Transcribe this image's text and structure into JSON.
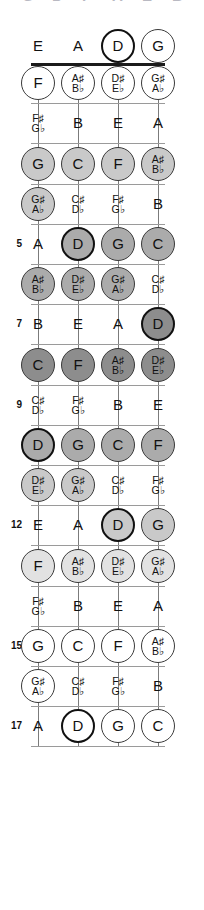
{
  "diagram": {
    "instrument": "4-string bass",
    "orientation": "vertical",
    "clipped_top_glyphs": [
      "G",
      "D",
      "F",
      "A",
      "E",
      "B"
    ],
    "strings": [
      "E",
      "A",
      "D",
      "G"
    ],
    "fret_numbers_shown": [
      "5",
      "7",
      "9",
      "12",
      "15",
      "17"
    ],
    "colors": {
      "nut": "#1b1b1b",
      "fretline": "#9a9a9a",
      "string": "#7b7b7b",
      "ring": "#3a3a3a",
      "root_ring": "#111111",
      "text": "#111111",
      "shade_dark": "#8d8d8d",
      "shade_mid": "#ababab",
      "shade_light": "#c9c9c9",
      "shade_pale": "#e2e2e2",
      "shade_white": "#ffffff"
    }
  },
  "chart_data": {
    "type": "table",
    "xlabel": "String",
    "ylabel": "Fret",
    "categories": [
      "E",
      "A",
      "D",
      "G"
    ],
    "frets": [
      {
        "fret": 0,
        "label": "",
        "fill": "none",
        "notes": [
          {
            "text": "E",
            "sharp": "",
            "flat": "",
            "style": "plain"
          },
          {
            "text": "A",
            "sharp": "",
            "flat": "",
            "style": "plain"
          },
          {
            "text": "D",
            "sharp": "",
            "flat": "",
            "style": "root"
          },
          {
            "text": "G",
            "sharp": "",
            "flat": "",
            "style": "ring"
          }
        ]
      },
      {
        "fret": 1,
        "label": "",
        "fill": "white",
        "notes": [
          {
            "text": "F",
            "sharp": "",
            "flat": "",
            "style": "ring"
          },
          {
            "text": "",
            "sharp": "A♯",
            "flat": "B♭",
            "style": "ring"
          },
          {
            "text": "",
            "sharp": "D♯",
            "flat": "E♭",
            "style": "ring"
          },
          {
            "text": "",
            "sharp": "G♯",
            "flat": "A♭",
            "style": "ring"
          }
        ]
      },
      {
        "fret": 2,
        "label": "",
        "fill": "none",
        "notes": [
          {
            "text": "",
            "sharp": "F♯",
            "flat": "G♭",
            "style": "plain"
          },
          {
            "text": "B",
            "sharp": "",
            "flat": "",
            "style": "plain"
          },
          {
            "text": "E",
            "sharp": "",
            "flat": "",
            "style": "plain"
          },
          {
            "text": "A",
            "sharp": "",
            "flat": "",
            "style": "plain"
          }
        ]
      },
      {
        "fret": 3,
        "label": "",
        "fill": "light",
        "notes": [
          {
            "text": "G",
            "sharp": "",
            "flat": "",
            "style": "ring"
          },
          {
            "text": "C",
            "sharp": "",
            "flat": "",
            "style": "ring"
          },
          {
            "text": "F",
            "sharp": "",
            "flat": "",
            "style": "ring"
          },
          {
            "text": "",
            "sharp": "A♯",
            "flat": "B♭",
            "style": "ring"
          }
        ]
      },
      {
        "fret": 4,
        "label": "",
        "fill": "light",
        "notes": [
          {
            "text": "",
            "sharp": "G♯",
            "flat": "A♭",
            "style": "ring"
          },
          {
            "text": "",
            "sharp": "C♯",
            "flat": "D♭",
            "style": "plain"
          },
          {
            "text": "",
            "sharp": "F♯",
            "flat": "G♭",
            "style": "plain"
          },
          {
            "text": "B",
            "sharp": "",
            "flat": "",
            "style": "plain"
          }
        ]
      },
      {
        "fret": 5,
        "label": "5",
        "fill": "mid",
        "notes": [
          {
            "text": "A",
            "sharp": "",
            "flat": "",
            "style": "plain"
          },
          {
            "text": "D",
            "sharp": "",
            "flat": "",
            "style": "root"
          },
          {
            "text": "G",
            "sharp": "",
            "flat": "",
            "style": "ring"
          },
          {
            "text": "C",
            "sharp": "",
            "flat": "",
            "style": "ring"
          }
        ]
      },
      {
        "fret": 6,
        "label": "",
        "fill": "mid",
        "notes": [
          {
            "text": "",
            "sharp": "A♯",
            "flat": "B♭",
            "style": "ring"
          },
          {
            "text": "",
            "sharp": "D♯",
            "flat": "E♭",
            "style": "ring"
          },
          {
            "text": "",
            "sharp": "G♯",
            "flat": "A♭",
            "style": "ring"
          },
          {
            "text": "",
            "sharp": "C♯",
            "flat": "D♭",
            "style": "plain"
          }
        ]
      },
      {
        "fret": 7,
        "label": "7",
        "fill": "dark",
        "notes": [
          {
            "text": "B",
            "sharp": "",
            "flat": "",
            "style": "plain"
          },
          {
            "text": "E",
            "sharp": "",
            "flat": "",
            "style": "plain"
          },
          {
            "text": "A",
            "sharp": "",
            "flat": "",
            "style": "plain"
          },
          {
            "text": "D",
            "sharp": "",
            "flat": "",
            "style": "root"
          }
        ]
      },
      {
        "fret": 8,
        "label": "",
        "fill": "dark",
        "notes": [
          {
            "text": "C",
            "sharp": "",
            "flat": "",
            "style": "ring"
          },
          {
            "text": "F",
            "sharp": "",
            "flat": "",
            "style": "ring"
          },
          {
            "text": "",
            "sharp": "A♯",
            "flat": "B♭",
            "style": "ring"
          },
          {
            "text": "",
            "sharp": "D♯",
            "flat": "E♭",
            "style": "ring"
          }
        ]
      },
      {
        "fret": 9,
        "label": "9",
        "fill": "none",
        "notes": [
          {
            "text": "",
            "sharp": "C♯",
            "flat": "D♭",
            "style": "plain"
          },
          {
            "text": "",
            "sharp": "F♯",
            "flat": "G♭",
            "style": "plain"
          },
          {
            "text": "B",
            "sharp": "",
            "flat": "",
            "style": "plain"
          },
          {
            "text": "E",
            "sharp": "",
            "flat": "",
            "style": "plain"
          }
        ]
      },
      {
        "fret": 10,
        "label": "",
        "fill": "mid",
        "notes": [
          {
            "text": "D",
            "sharp": "",
            "flat": "",
            "style": "root"
          },
          {
            "text": "G",
            "sharp": "",
            "flat": "",
            "style": "ring"
          },
          {
            "text": "C",
            "sharp": "",
            "flat": "",
            "style": "ring"
          },
          {
            "text": "F",
            "sharp": "",
            "flat": "",
            "style": "ring"
          }
        ]
      },
      {
        "fret": 11,
        "label": "",
        "fill": "light",
        "notes": [
          {
            "text": "",
            "sharp": "D♯",
            "flat": "E♭",
            "style": "ring"
          },
          {
            "text": "",
            "sharp": "G♯",
            "flat": "A♭",
            "style": "ring"
          },
          {
            "text": "",
            "sharp": "C♯",
            "flat": "D♭",
            "style": "plain"
          },
          {
            "text": "",
            "sharp": "F♯",
            "flat": "G♭",
            "style": "plain"
          }
        ]
      },
      {
        "fret": 12,
        "label": "12",
        "fill": "light",
        "notes": [
          {
            "text": "E",
            "sharp": "",
            "flat": "",
            "style": "plain"
          },
          {
            "text": "A",
            "sharp": "",
            "flat": "",
            "style": "plain"
          },
          {
            "text": "D",
            "sharp": "",
            "flat": "",
            "style": "root"
          },
          {
            "text": "G",
            "sharp": "",
            "flat": "",
            "style": "ring"
          }
        ]
      },
      {
        "fret": 13,
        "label": "",
        "fill": "pale",
        "notes": [
          {
            "text": "F",
            "sharp": "",
            "flat": "",
            "style": "ring"
          },
          {
            "text": "",
            "sharp": "A♯",
            "flat": "B♭",
            "style": "ring"
          },
          {
            "text": "",
            "sharp": "D♯",
            "flat": "E♭",
            "style": "ring"
          },
          {
            "text": "",
            "sharp": "G♯",
            "flat": "A♭",
            "style": "ring"
          }
        ]
      },
      {
        "fret": 14,
        "label": "",
        "fill": "none",
        "notes": [
          {
            "text": "",
            "sharp": "F♯",
            "flat": "G♭",
            "style": "plain"
          },
          {
            "text": "B",
            "sharp": "",
            "flat": "",
            "style": "plain"
          },
          {
            "text": "E",
            "sharp": "",
            "flat": "",
            "style": "plain"
          },
          {
            "text": "A",
            "sharp": "",
            "flat": "",
            "style": "plain"
          }
        ]
      },
      {
        "fret": 15,
        "label": "15",
        "fill": "white",
        "notes": [
          {
            "text": "G",
            "sharp": "",
            "flat": "",
            "style": "ring"
          },
          {
            "text": "C",
            "sharp": "",
            "flat": "",
            "style": "ring"
          },
          {
            "text": "F",
            "sharp": "",
            "flat": "",
            "style": "ring"
          },
          {
            "text": "",
            "sharp": "A♯",
            "flat": "B♭",
            "style": "ring"
          }
        ]
      },
      {
        "fret": 16,
        "label": "",
        "fill": "white",
        "notes": [
          {
            "text": "",
            "sharp": "G♯",
            "flat": "A♭",
            "style": "ring"
          },
          {
            "text": "",
            "sharp": "C♯",
            "flat": "D♭",
            "style": "plain"
          },
          {
            "text": "",
            "sharp": "F♯",
            "flat": "G♭",
            "style": "plain"
          },
          {
            "text": "B",
            "sharp": "",
            "flat": "",
            "style": "plain"
          }
        ]
      },
      {
        "fret": 17,
        "label": "17",
        "fill": "white",
        "notes": [
          {
            "text": "A",
            "sharp": "",
            "flat": "",
            "style": "plain"
          },
          {
            "text": "D",
            "sharp": "",
            "flat": "",
            "style": "root"
          },
          {
            "text": "G",
            "sharp": "",
            "flat": "",
            "style": "ring"
          },
          {
            "text": "C",
            "sharp": "",
            "flat": "",
            "style": "ring"
          }
        ]
      }
    ]
  }
}
